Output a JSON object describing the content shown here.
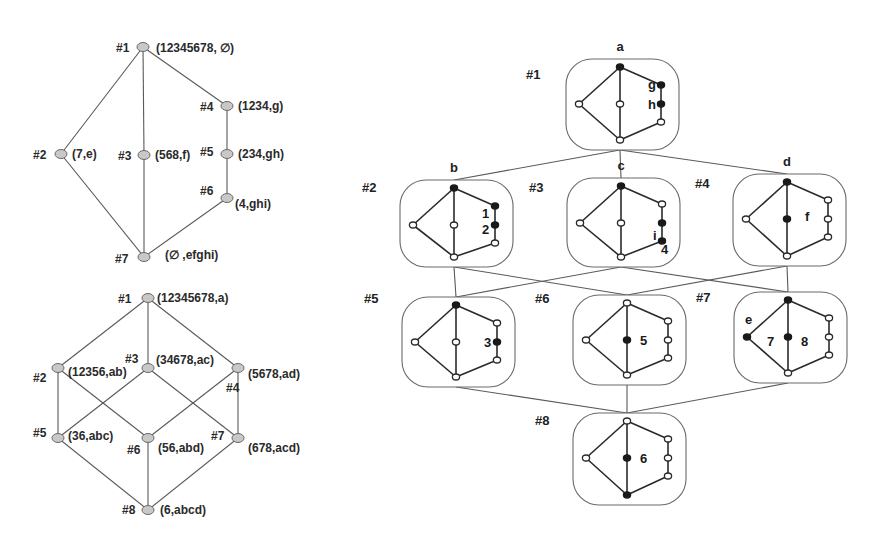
{
  "colors": {
    "background": "#ffffff",
    "lattice_node_fill": "#c8c8c8",
    "edge": "#5a5a5a",
    "filled_vertex": "#1a1a1a"
  },
  "lattice_top": {
    "nodes": [
      {
        "id": "#1",
        "label": "(12345678, ∅)",
        "x": 143,
        "y": 47,
        "tx": -27,
        "ty": 5,
        "lx": 13,
        "ly": 5
      },
      {
        "id": "#2",
        "label": "(7,e)",
        "x": 61,
        "y": 154,
        "tx": -28,
        "ty": 5,
        "lx": 11,
        "ly": 4
      },
      {
        "id": "#3",
        "label": "(568,f)",
        "x": 144,
        "y": 155,
        "tx": -26,
        "ty": 5,
        "lx": 11,
        "ly": 4
      },
      {
        "id": "#4",
        "label": "(1234,g)",
        "x": 227,
        "y": 106,
        "tx": -27,
        "ty": 5,
        "lx": 11,
        "ly": 4
      },
      {
        "id": "#5",
        "label": "(234,gh)",
        "x": 227,
        "y": 154,
        "tx": -27,
        "ty": 2,
        "lx": 11,
        "ly": 4
      },
      {
        "id": "#6",
        "label": "(4,ghi)",
        "x": 227,
        "y": 198,
        "tx": -27,
        "ty": -3,
        "lx": 8,
        "ly": 10
      },
      {
        "id": "#7",
        "label": "(∅ ,efghi)",
        "x": 144,
        "y": 257,
        "tx": -29,
        "ty": 6,
        "lx": 21,
        "ly": 2
      }
    ],
    "edges": [
      [
        "#1",
        "#2"
      ],
      [
        "#1",
        "#3"
      ],
      [
        "#1",
        "#4"
      ],
      [
        "#4",
        "#5"
      ],
      [
        "#5",
        "#6"
      ],
      [
        "#2",
        "#7"
      ],
      [
        "#3",
        "#7"
      ],
      [
        "#6",
        "#7"
      ]
    ]
  },
  "lattice_bottom": {
    "nodes": [
      {
        "id": "#1",
        "label": "(12345678,a)",
        "x": 148,
        "y": 298,
        "tx": -30,
        "ty": 5,
        "lx": 9,
        "ly": 4
      },
      {
        "id": "#2",
        "label": "(12356,ab)",
        "x": 58,
        "y": 368,
        "tx": -25,
        "ty": 14,
        "lx": 10,
        "ly": 8
      },
      {
        "id": "#3",
        "label": "(34678,ac)",
        "x": 148,
        "y": 368,
        "tx": -23,
        "ty": -5,
        "lx": 8,
        "ly": -4
      },
      {
        "id": "#4",
        "label": "(5678,ad)",
        "x": 238,
        "y": 368,
        "tx": -12,
        "ty": 24,
        "lx": 10,
        "ly": 10
      },
      {
        "id": "#5",
        "label": "(36,abc)",
        "x": 58,
        "y": 438,
        "tx": -25,
        "ty": -1,
        "lx": 10,
        "ly": 2
      },
      {
        "id": "#6",
        "label": "(56,abd)",
        "x": 148,
        "y": 438,
        "tx": -21,
        "ty": 16,
        "lx": 10,
        "ly": 14
      },
      {
        "id": "#7",
        "label": "(678,acd)",
        "x": 238,
        "y": 438,
        "tx": -27,
        "ty": 2,
        "lx": 10,
        "ly": 14
      },
      {
        "id": "#8",
        "label": "(6,abcd)",
        "x": 148,
        "y": 510,
        "tx": -26,
        "ty": 4,
        "lx": 12,
        "ly": 4
      }
    ],
    "edges": [
      [
        "#1",
        "#2"
      ],
      [
        "#1",
        "#3"
      ],
      [
        "#1",
        "#4"
      ],
      [
        "#2",
        "#5"
      ],
      [
        "#2",
        "#6"
      ],
      [
        "#3",
        "#5"
      ],
      [
        "#3",
        "#7"
      ],
      [
        "#4",
        "#6"
      ],
      [
        "#4",
        "#7"
      ],
      [
        "#5",
        "#8"
      ],
      [
        "#6",
        "#8"
      ],
      [
        "#7",
        "#8"
      ]
    ]
  },
  "graph_lattice": {
    "boxes": [
      {
        "id": "#1",
        "letter": "a",
        "x": 566,
        "y": 59,
        "w": 113,
        "h": 91,
        "tag_dx": -40,
        "tag_dy": 20,
        "filled": [
          "top",
          "rt",
          "rm"
        ],
        "show_rm": true,
        "show_mid": true,
        "mid_filled": false,
        "labels": [
          {
            "text": "g",
            "dx": 82,
            "dy": 30
          },
          {
            "text": "h",
            "dx": 82,
            "dy": 50
          }
        ]
      },
      {
        "id": "#2",
        "letter": "b",
        "x": 400,
        "y": 180,
        "w": 113,
        "h": 87,
        "tag_dx": -38,
        "tag_dy": 12,
        "filled": [
          "top",
          "rt",
          "rm"
        ],
        "show_rm": true,
        "show_mid": true,
        "mid_filled": false,
        "labels": [
          {
            "text": "1",
            "dx": 82,
            "dy": 38
          },
          {
            "text": "2",
            "dx": 82,
            "dy": 54
          }
        ]
      },
      {
        "id": "#3",
        "letter": "c",
        "x": 567,
        "y": 178,
        "w": 113,
        "h": 89,
        "tag_dx": -38,
        "tag_dy": 14,
        "filled": [
          "top",
          "rm",
          "rb"
        ],
        "show_rm": true,
        "show_mid": true,
        "mid_filled": false,
        "labels": [
          {
            "text": "i",
            "dx": 86,
            "dy": 62
          },
          {
            "text": "4",
            "dx": 94,
            "dy": 76
          }
        ]
      },
      {
        "id": "#4",
        "letter": "d",
        "x": 733,
        "y": 174,
        "w": 113,
        "h": 92,
        "tag_dx": -38,
        "tag_dy": 14,
        "filled": [
          "top"
        ],
        "show_rm": true,
        "show_mid": true,
        "mid_filled": true,
        "labels": [
          {
            "text": "f",
            "dx": 72,
            "dy": 47
          }
        ]
      },
      {
        "id": "#5",
        "letter": "",
        "x": 402,
        "y": 297,
        "w": 113,
        "h": 90,
        "tag_dx": -38,
        "tag_dy": 6,
        "filled": [
          "top",
          "rm"
        ],
        "show_rm": true,
        "show_mid": true,
        "mid_filled": false,
        "labels": [
          {
            "text": "3",
            "dx": 82,
            "dy": 50
          }
        ]
      },
      {
        "id": "#6",
        "letter": "",
        "x": 573,
        "y": 295,
        "w": 113,
        "h": 90,
        "tag_dx": -38,
        "tag_dy": 8,
        "filled": [],
        "show_rm": true,
        "show_mid": true,
        "mid_filled": true,
        "labels": [
          {
            "text": "5",
            "dx": 67,
            "dy": 50
          }
        ]
      },
      {
        "id": "#7",
        "letter": "",
        "x": 734,
        "y": 292,
        "w": 113,
        "h": 91,
        "tag_dx": -38,
        "tag_dy": 10,
        "filled": [
          "top",
          "left"
        ],
        "show_rm": true,
        "show_mid": true,
        "mid_filled": true,
        "labels": [
          {
            "text": "e",
            "dx": 11,
            "dy": 32
          },
          {
            "text": "7",
            "dx": 33,
            "dy": 54
          },
          {
            "text": "8",
            "dx": 67,
            "dy": 54
          }
        ]
      },
      {
        "id": "#8",
        "letter": "",
        "x": 573,
        "y": 413,
        "w": 113,
        "h": 92,
        "tag_dx": -38,
        "tag_dy": 12,
        "filled": [
          "bot"
        ],
        "show_rm": true,
        "show_mid": true,
        "mid_filled": true,
        "labels": [
          {
            "text": "6",
            "dx": 67,
            "dy": 50
          }
        ]
      }
    ],
    "connections": [
      [
        "#1",
        "#2"
      ],
      [
        "#1",
        "#3"
      ],
      [
        "#1",
        "#4"
      ],
      [
        "#2",
        "#5"
      ],
      [
        "#2",
        "#6"
      ],
      [
        "#3",
        "#5"
      ],
      [
        "#3",
        "#7"
      ],
      [
        "#4",
        "#6"
      ],
      [
        "#4",
        "#7"
      ],
      [
        "#5",
        "#8"
      ],
      [
        "#6",
        "#8"
      ],
      [
        "#7",
        "#8"
      ]
    ]
  }
}
